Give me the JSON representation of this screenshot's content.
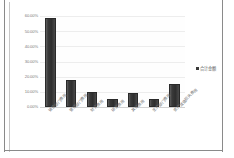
{
  "chart_data": {
    "type": "bar",
    "title": "",
    "xlabel": "",
    "ylabel": "",
    "grid": true,
    "legend_position": "right",
    "ylim": [
      0,
      60
    ],
    "ytick_labels": [
      "60.00%",
      "50.00%",
      "40.00%",
      "30.00%",
      "20.00%",
      "10.00%",
      "0.00%"
    ],
    "ytick_values": [
      60,
      50,
      40,
      30,
      20,
      10,
      0
    ],
    "categories": [
      "销售部门费用",
      "管理部门费用",
      "财务费用",
      "研发费用",
      "其他费用",
      "生产部门费用",
      "资产减值损失费用"
    ],
    "series": [
      {
        "name": "合计金额",
        "values": [
          59.0,
          18.0,
          10.0,
          5.5,
          9.0,
          5.0,
          15.0
        ]
      }
    ],
    "bar_color": "#3a3a3a"
  },
  "legend": {
    "label": "合计金额",
    "marker": "square-marker"
  },
  "colors": {
    "bar": "#3a3a3a",
    "grid": "#ededed",
    "axis": "#d2d2d2",
    "tick_text": "#7a7a7a",
    "frame": "#8a8a8a",
    "background": "#ffffff"
  }
}
